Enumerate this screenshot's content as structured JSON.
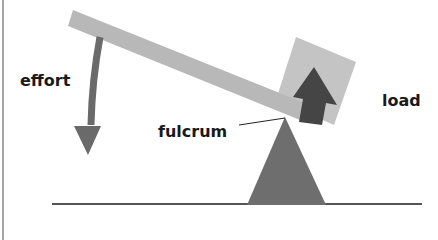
{
  "diagram": {
    "labels": {
      "effort": "effort",
      "load": "load",
      "fulcrum": "fulcrum"
    },
    "colors": {
      "lever": "#b8b8b8",
      "load_box": "#c4c4c4",
      "load_arrow": "#454545",
      "effort_arrow": "#6a6a6a",
      "fulcrum": "#6e6e6e",
      "ground": "#555555",
      "text": "#1a1a1a"
    }
  }
}
